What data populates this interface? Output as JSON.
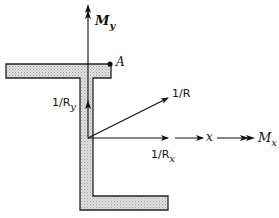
{
  "diagram": {
    "section": {
      "shape": "Z-section (top flange, web, bottom flange)",
      "fill_color": "#d9d9d9",
      "stroke_color": "#222222"
    },
    "point_A": {
      "label": "A"
    },
    "labels": {
      "My_main": "M",
      "My_sub": "y",
      "Mx_main": "M",
      "Mx_sub": "x",
      "x_axis": "x",
      "inv_R": "1/R",
      "inv_Ry_main": "1/R",
      "inv_Ry_sub": "y",
      "inv_Rx_main": "1/R",
      "inv_Rx_sub": "x"
    },
    "vectors": [
      {
        "name": "M_y",
        "direction": "up",
        "style": "double-arrowhead"
      },
      {
        "name": "M_x",
        "direction": "right",
        "style": "double-arrowhead"
      },
      {
        "name": "1/R_y",
        "direction": "up",
        "style": "single-arrowhead"
      },
      {
        "name": "1/R_x",
        "direction": "right",
        "style": "single-arrowhead"
      },
      {
        "name": "1/R",
        "direction": "up-right",
        "style": "single-arrowhead"
      }
    ]
  }
}
